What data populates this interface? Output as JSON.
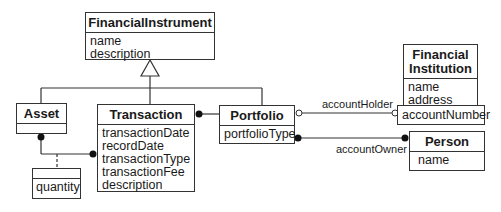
{
  "diagram": {
    "type": "UML class diagram",
    "classes": {
      "financial_instrument": {
        "name": "FinancialInstrument",
        "attributes": [
          "name",
          "description"
        ]
      },
      "asset": {
        "name": "Asset",
        "attributes": []
      },
      "transaction": {
        "name": "Transaction",
        "attributes": [
          "transactionDate",
          "recordDate",
          "transactionType",
          "transactionFee",
          "description"
        ]
      },
      "portfolio": {
        "name": "Portfolio",
        "attributes": [
          "portfolioType"
        ]
      },
      "financial_institution": {
        "name_line1": "Financial",
        "name_line2": "Institution",
        "attributes": [
          "name",
          "address"
        ],
        "qualifier": "accountNumber"
      },
      "person": {
        "name": "Person",
        "attributes": [
          "name"
        ]
      },
      "link_attribute": {
        "name": "",
        "attributes": [
          "quantity"
        ]
      }
    },
    "associations": {
      "account_holder": "accountHolder",
      "account_owner": "accountOwner"
    },
    "relationships": [
      {
        "type": "generalization",
        "parent": "FinancialInstrument",
        "children": [
          "Asset",
          "Transaction",
          "Portfolio"
        ]
      },
      {
        "type": "association",
        "from": "Asset",
        "to": "Transaction",
        "multiplicity": "many-to-many",
        "link_attribute": "quantity"
      },
      {
        "type": "association",
        "from": "Transaction",
        "to": "Portfolio",
        "multiplicity": "many"
      },
      {
        "type": "qualified-association",
        "name": "accountHolder",
        "from": "Portfolio",
        "to": "FinancialInstrument",
        "qualifier": "accountNumber",
        "multiplicity": "optional"
      },
      {
        "type": "association",
        "name": "accountOwner",
        "from": "Portfolio",
        "to": "Person",
        "multiplicity": "many-to-many"
      }
    ]
  }
}
